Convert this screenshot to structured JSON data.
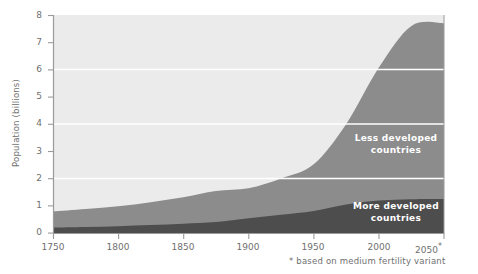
{
  "chart_data": {
    "type": "area",
    "title": "",
    "subtitle": "",
    "xlabel": "",
    "ylabel": "Population (billions)",
    "xlim": [
      1750,
      2050
    ],
    "ylim": [
      0,
      8
    ],
    "grid": "horizontal-white-gridlines-at-2-4-6",
    "legend_position": "inline-labels-on-areas",
    "stacked": true,
    "x": [
      1750,
      1775,
      1800,
      1825,
      1850,
      1875,
      1900,
      1925,
      1950,
      1975,
      2000,
      2025,
      2050
    ],
    "series": [
      {
        "name": "More developed countries",
        "color": "#4d4d4d",
        "values": [
          0.2,
          0.22,
          0.25,
          0.29,
          0.34,
          0.4,
          0.54,
          0.67,
          0.81,
          1.05,
          1.19,
          1.24,
          1.25
        ]
      },
      {
        "name": "Less developed countries",
        "color": "#8c8c8c",
        "values": [
          0.59,
          0.66,
          0.73,
          0.84,
          0.97,
          1.14,
          1.1,
          1.33,
          1.71,
          2.95,
          4.88,
          6.36,
          6.45
        ]
      }
    ],
    "totals": [
      0.79,
      0.88,
      0.98,
      1.13,
      1.31,
      1.54,
      1.64,
      2.0,
      2.52,
      4.0,
      6.07,
      7.6,
      7.7
    ],
    "y_ticks": [
      0,
      1,
      2,
      3,
      4,
      5,
      6,
      7,
      8
    ],
    "x_ticks": [
      1750,
      1800,
      1850,
      1900,
      1950,
      2000,
      2050
    ],
    "x_tick_labels": [
      "1750",
      "1800",
      "1850",
      "1900",
      "1950",
      "2000",
      "2050*"
    ],
    "gridline_values": [
      2,
      4,
      6
    ],
    "annotations": [
      {
        "text": "Less developed countries",
        "series": "Less developed countries"
      },
      {
        "text": "More developed countries",
        "series": "More developed countries"
      }
    ],
    "footnote": "* based on medium fertility variant",
    "plot_background": "#ebebeb"
  },
  "axes": {
    "y_title": "Population (billions)",
    "y_labels": [
      "8",
      "7",
      "6",
      "5",
      "4",
      "3",
      "2",
      "1",
      "0"
    ],
    "x_labels": [
      "1750",
      "1800",
      "1850",
      "1900",
      "1950",
      "2000",
      "2050"
    ],
    "x_last_marker": "*"
  },
  "labels": {
    "less_developed_line1": "Less  developed",
    "less_developed_line2": "countries",
    "more_developed_line1": "More  developed",
    "more_developed_line2": "countries"
  },
  "footnote": {
    "text": "* based on medium fertility variant"
  },
  "colors": {
    "plot_bg": "#ebebeb",
    "less_developed": "#8c8c8c",
    "more_developed": "#4d4d4d",
    "gridline": "#ffffff",
    "axis": "#9a9a9a",
    "text": "#6f6f6f",
    "label_text": "#ffffff",
    "page_bg": "#ffffff"
  }
}
